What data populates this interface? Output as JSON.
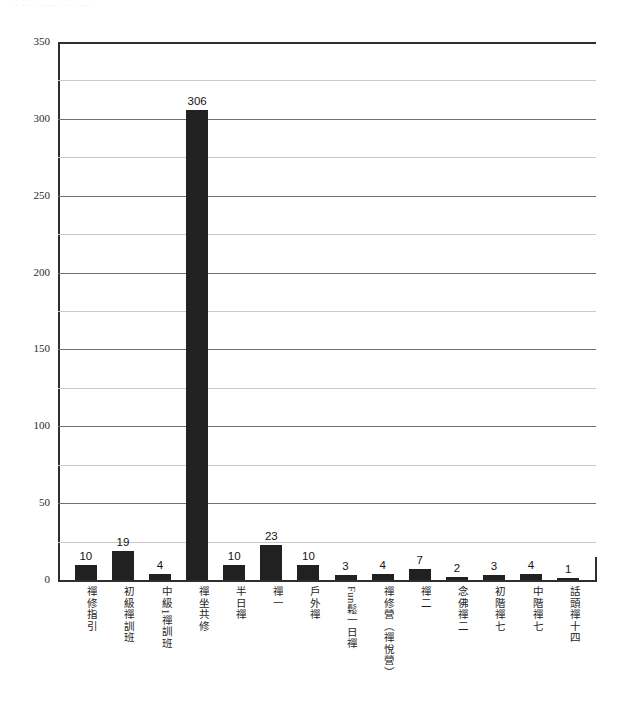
{
  "scan_artifact": {
    "text": "· · ···· ····· ···· ··· ·"
  },
  "chart_data": {
    "type": "bar",
    "title": "",
    "subtitle": "",
    "xlabel": "",
    "ylabel": "",
    "ylim": [
      0,
      350
    ],
    "ytick_labels": [
      "350",
      "300",
      "250",
      "200",
      "150",
      "100",
      "50",
      "0"
    ],
    "ytick_values": [
      350,
      300,
      250,
      200,
      150,
      100,
      50,
      0
    ],
    "ytick_step": 50,
    "gridline_step": 25,
    "grid": true,
    "legend": "none",
    "bar_color": "#212121",
    "show_value_labels": true,
    "categories": [
      "禪修指引",
      "初級禪訓班",
      "中級1禪訓班",
      "禪坐共修",
      "半日禪",
      "禪一",
      "戶外禪",
      "Fun鬆一日禪",
      "禪修營（禪悅營）",
      "禪二",
      "念佛禪二",
      "初階禪七",
      "中階禪七",
      "話頭禪十四"
    ],
    "values": [
      10,
      19,
      4,
      306,
      10,
      23,
      10,
      3,
      4,
      7,
      2,
      3,
      4,
      1
    ],
    "value_labels": [
      "10",
      "19",
      "4",
      "306",
      "10",
      "23",
      "10",
      "3",
      "4",
      "7",
      "2",
      "3",
      "4",
      "1"
    ]
  }
}
